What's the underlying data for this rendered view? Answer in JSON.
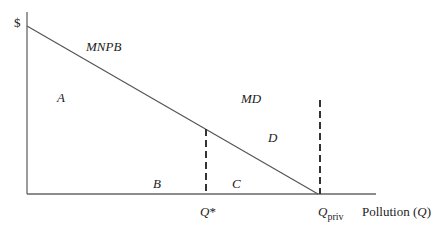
{
  "diagram": {
    "title": "",
    "y_axis_label": "$",
    "x_axis_label": "Pollution (Q)",
    "x_axis_label_text": "Pollution (",
    "x_axis_label_var": "Q",
    "x_axis_label_close": ")",
    "curves": [
      {
        "name": "MNPB",
        "label": "MNPB",
        "type": "downward-sloping line",
        "from": [
          27,
          26
        ],
        "to": [
          318,
          194
        ]
      },
      {
        "name": "MD",
        "label": "MD"
      }
    ],
    "markers": [
      {
        "name": "Q-star",
        "label_main": "Q",
        "label_suffix": "*",
        "x": 206
      },
      {
        "name": "Q-priv",
        "label_main": "Q",
        "label_sub": "priv",
        "x": 320
      }
    ],
    "regions": [
      "A",
      "B",
      "C",
      "D"
    ],
    "colors": {
      "line": "#555555",
      "text": "#222222",
      "background": "#ffffff"
    }
  }
}
